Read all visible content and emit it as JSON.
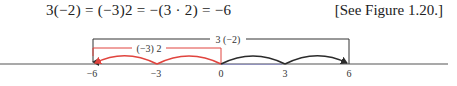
{
  "equation": {
    "text": "3(−2) = (−3)2 = −(3 · 2) = −6"
  },
  "figure_reference": {
    "text": "[See Figure 1.20.]"
  },
  "number_line": {
    "tick_labels": [
      "−6",
      "−3",
      "0",
      "3",
      "6"
    ],
    "tick_values": [
      -6,
      -3,
      0,
      3,
      6
    ],
    "black_bracket": {
      "label": "3 (−2)",
      "from": -6,
      "to": 6,
      "color": "#333333"
    },
    "red_bracket": {
      "label": "(−3) 2",
      "from": -6,
      "to": 0,
      "color": "#e0443e"
    },
    "black_arcs": {
      "description": "two jumps of 3 from 0 to 6",
      "color": "#2b2b2b"
    },
    "red_arcs": {
      "description": "two jumps of −3 from 0 to −6",
      "color": "#e0443e"
    },
    "axis_color": "#555555"
  }
}
